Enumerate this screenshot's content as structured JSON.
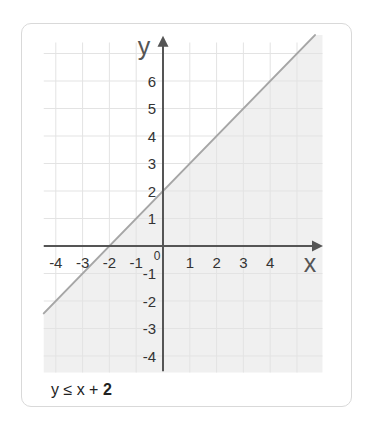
{
  "chart_data": {
    "type": "line",
    "title": "y ≤ x + 2",
    "subtitle": "",
    "xlabel": "x",
    "ylabel": "y",
    "xlim": [
      -4.45,
      5.95
    ],
    "ylim": [
      -4.6,
      7.4
    ],
    "axis_extent": {
      "x": [
        -4.45,
        5.97
      ],
      "y": [
        -4.55,
        7.65
      ]
    },
    "grid": true,
    "x_ticks": [
      -4,
      -3,
      -2,
      -1,
      1,
      2,
      3,
      4
    ],
    "y_ticks": [
      -4,
      -3,
      -2,
      -1,
      1,
      2,
      3,
      4,
      5,
      6
    ],
    "origin_label": "0",
    "series": [
      {
        "name": "y = x + 2",
        "x": [
          -4.45,
          5.67
        ],
        "y": [
          -2.45,
          7.67
        ],
        "color": "#a6a6a6"
      }
    ],
    "shaded_region": {
      "description": "y ≤ x + 2 (region below the line)",
      "color": "#f0f0f0"
    },
    "legend": null
  },
  "caption": {
    "prefix": "y ≤ x + ",
    "emphasis": "2"
  },
  "colors": {
    "axis": "#555555",
    "grid": "#e3e3e3",
    "tick_label": "#333333",
    "card_border": "#d9d9d9"
  }
}
